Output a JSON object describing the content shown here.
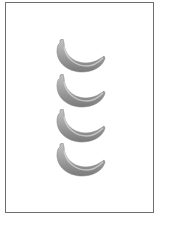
{
  "card": {
    "item": "banana",
    "count": 4,
    "count_label": "4",
    "items": [
      {
        "name": "banana",
        "top": 39
      },
      {
        "name": "banana",
        "top": 74
      },
      {
        "name": "banana",
        "top": 109
      },
      {
        "name": "banana",
        "top": 143
      }
    ],
    "colors": {
      "border": "#6e6e6e",
      "fruit": "#8a8a8a",
      "fruit_light": "#c4c4c4",
      "background": "#ffffff"
    }
  }
}
